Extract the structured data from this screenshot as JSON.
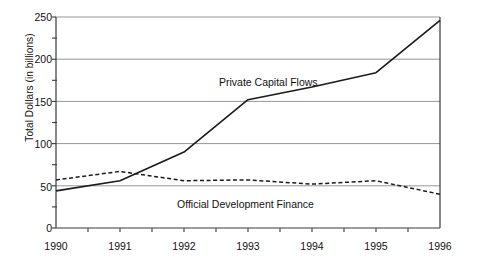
{
  "chart_data": {
    "type": "line",
    "title": "",
    "subtitle": "",
    "xlabel": "",
    "ylabel": "Total Dollars (in billions)",
    "xlim": [
      1990,
      1996
    ],
    "ylim": [
      0,
      250
    ],
    "grid": "horizontal-major",
    "legend_position": "inline-annotation",
    "x": [
      1990,
      1991,
      1992,
      1993,
      1994,
      1995,
      1996
    ],
    "x_tick_labels": [
      "1990",
      "1991",
      "1992",
      "1993",
      "1994",
      "1995",
      "1996"
    ],
    "x_minor_ticks": [
      1990.5,
      1991.5,
      1992.5,
      1993.5,
      1994.5,
      1995.5
    ],
    "y_tick_labels": [
      "0",
      "50",
      "100",
      "150",
      "200",
      "250"
    ],
    "y_ticks": [
      0,
      50,
      100,
      150,
      200,
      250
    ],
    "y_minor_ticks": [
      25,
      75,
      125,
      175,
      225
    ],
    "series": [
      {
        "name": "Private Capital Flows",
        "style": "solid",
        "color": "#1a1a1a",
        "values": [
          44,
          56,
          90,
          152,
          167,
          184,
          246
        ],
        "label_text": "Private Capital Flows"
      },
      {
        "name": "Official Development Finance",
        "style": "dashed",
        "color": "#1a1a1a",
        "values": [
          57,
          67,
          56,
          57,
          52,
          56,
          40
        ],
        "label_text": "Official Development Finance"
      }
    ],
    "annotations": [
      {
        "text": "Private Capital Flows",
        "x": 1993.0,
        "y": 175
      },
      {
        "text": "Official Development Finance",
        "x": 1993.0,
        "y": 27
      }
    ]
  },
  "axis": {
    "y_title": "Total Dollars (in billions)",
    "y_labels": [
      "250",
      "200",
      "150",
      "100",
      "50",
      "0"
    ],
    "x_labels": [
      "1990",
      "1991",
      "1992",
      "1993",
      "1994",
      "1995",
      "1996"
    ]
  },
  "labels": {
    "private": "Private Capital Flows",
    "official": "Official Development Finance"
  },
  "colors": {
    "ink": "#1a1a1a",
    "grid": "#8a8a8a",
    "background": "#ffffff"
  }
}
